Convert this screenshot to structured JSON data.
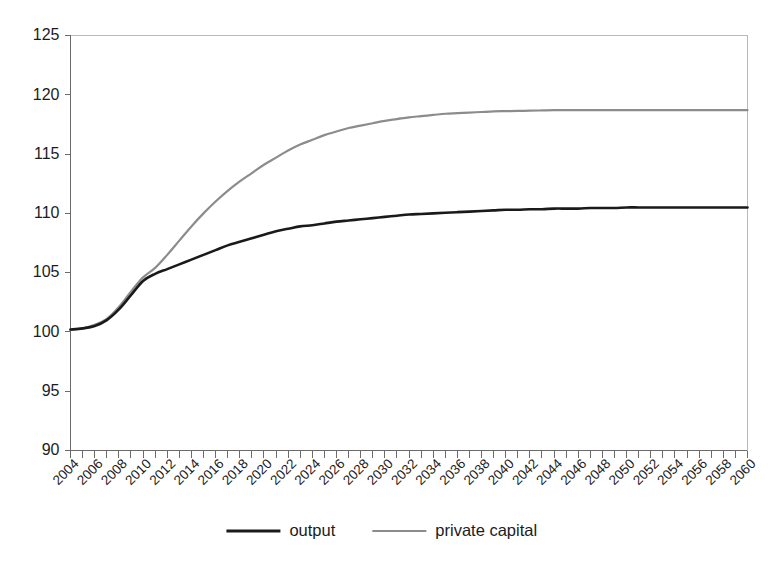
{
  "figure": {
    "background_color": "#ffffff",
    "axis_color": "#6b6b6b",
    "text_color": "#1c1c1c"
  },
  "chart_data": {
    "type": "line",
    "title": "",
    "subtitle": "",
    "xlabel": "",
    "ylabel": "",
    "xlim": [
      2004,
      2060
    ],
    "ylim": [
      90,
      125
    ],
    "grid": false,
    "legend_position": "bottom-center",
    "y_ticks": [
      90,
      95,
      100,
      105,
      110,
      115,
      120,
      125
    ],
    "y_tick_labels": [
      "90",
      "95",
      "100",
      "105",
      "110",
      "115",
      "120",
      "125"
    ],
    "x_minor_tick_step": 1,
    "x_tick_label_step": 2,
    "x_tick_rotation": -45,
    "categories": [
      2004,
      2005,
      2006,
      2007,
      2008,
      2009,
      2010,
      2011,
      2012,
      2013,
      2014,
      2015,
      2016,
      2017,
      2018,
      2019,
      2020,
      2021,
      2022,
      2023,
      2024,
      2025,
      2026,
      2027,
      2028,
      2029,
      2030,
      2031,
      2032,
      2033,
      2034,
      2035,
      2036,
      2037,
      2038,
      2039,
      2040,
      2041,
      2042,
      2043,
      2044,
      2045,
      2046,
      2047,
      2048,
      2049,
      2050,
      2051,
      2052,
      2053,
      2054,
      2055,
      2056,
      2057,
      2058,
      2059,
      2060
    ],
    "x_tick_labels": [
      "2004",
      "2006",
      "2008",
      "2010",
      "2012",
      "2014",
      "2016",
      "2018",
      "2020",
      "2022",
      "2024",
      "2026",
      "2028",
      "2030",
      "2032",
      "2034",
      "2036",
      "2038",
      "2040",
      "2042",
      "2044",
      "2046",
      "2048",
      "2050",
      "2052",
      "2054",
      "2056",
      "2058",
      "2060"
    ],
    "series": [
      {
        "name": "output",
        "color": "#1a1a1a",
        "line_width": 2.6,
        "values": [
          100.2,
          100.3,
          100.5,
          101.0,
          101.9,
          103.1,
          104.3,
          104.9,
          105.3,
          105.7,
          106.1,
          106.5,
          106.9,
          107.3,
          107.6,
          107.9,
          108.2,
          108.5,
          108.7,
          108.9,
          109.0,
          109.15,
          109.3,
          109.4,
          109.5,
          109.6,
          109.7,
          109.8,
          109.9,
          109.95,
          110.0,
          110.05,
          110.1,
          110.15,
          110.2,
          110.25,
          110.3,
          110.3,
          110.35,
          110.35,
          110.4,
          110.4,
          110.4,
          110.45,
          110.45,
          110.45,
          110.5,
          110.5,
          110.5,
          110.5,
          110.5,
          110.5,
          110.5,
          110.5,
          110.5,
          110.5,
          110.5
        ]
      },
      {
        "name": "private capital",
        "color": "#8c8c8c",
        "line_width": 2.2,
        "values": [
          100.2,
          100.3,
          100.6,
          101.1,
          102.1,
          103.4,
          104.6,
          105.4,
          106.5,
          107.7,
          108.9,
          110.0,
          111.0,
          111.9,
          112.7,
          113.4,
          114.1,
          114.7,
          115.3,
          115.8,
          116.2,
          116.6,
          116.9,
          117.2,
          117.4,
          117.6,
          117.8,
          117.95,
          118.1,
          118.2,
          118.3,
          118.4,
          118.45,
          118.5,
          118.55,
          118.6,
          118.62,
          118.64,
          118.66,
          118.68,
          118.7,
          118.7,
          118.7,
          118.7,
          118.7,
          118.7,
          118.7,
          118.7,
          118.7,
          118.7,
          118.7,
          118.7,
          118.7,
          118.7,
          118.7,
          118.7,
          118.7
        ]
      }
    ]
  },
  "legend": {
    "items": [
      {
        "label": "output",
        "color": "#1a1a1a",
        "line_width": 3.2
      },
      {
        "label": "private capital",
        "color": "#8c8c8c",
        "line_width": 2.2
      }
    ]
  }
}
